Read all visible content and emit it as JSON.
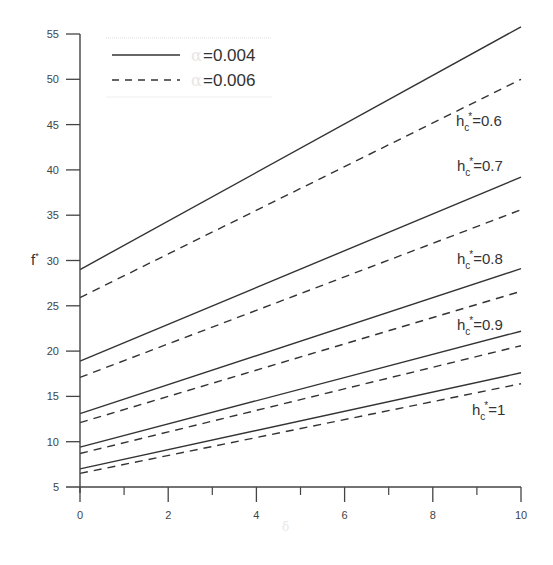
{
  "chart_data": {
    "type": "line",
    "title": "",
    "xlabel": "δ",
    "ylabel": "f*",
    "xlim": [
      0,
      10
    ],
    "ylim": [
      5,
      55
    ],
    "xticks": [
      0,
      2,
      4,
      6,
      8,
      10
    ],
    "xticks_minor": [
      1,
      3,
      5,
      7,
      9
    ],
    "yticks": [
      5,
      10,
      15,
      20,
      25,
      30,
      35,
      40,
      45,
      50,
      55
    ],
    "grid": false,
    "legend": {
      "position": "upper-left",
      "entries": [
        {
          "symbol": "α",
          "text": "=0.004",
          "style": "solid"
        },
        {
          "symbol": "α",
          "text": "=0.006",
          "style": "dashed"
        }
      ]
    },
    "series": [
      {
        "name": "hc*=0.6, α=0.004",
        "style": "solid",
        "x": [
          0,
          10
        ],
        "y": [
          29.0,
          55.8
        ]
      },
      {
        "name": "hc*=0.6, α=0.006",
        "style": "dashed",
        "x": [
          0,
          10
        ],
        "y": [
          25.9,
          50.0
        ]
      },
      {
        "name": "hc*=0.7, α=0.004",
        "style": "solid",
        "x": [
          0,
          10
        ],
        "y": [
          18.9,
          39.2
        ]
      },
      {
        "name": "hc*=0.7, α=0.006",
        "style": "dashed",
        "x": [
          0,
          10
        ],
        "y": [
          17.1,
          35.6
        ]
      },
      {
        "name": "hc*=0.8, α=0.004",
        "style": "solid",
        "x": [
          0,
          10
        ],
        "y": [
          13.1,
          29.1
        ]
      },
      {
        "name": "hc*=0.8, α=0.006",
        "style": "dashed",
        "x": [
          0,
          10
        ],
        "y": [
          12.1,
          26.6
        ]
      },
      {
        "name": "hc*=0.9, α=0.004",
        "style": "solid",
        "x": [
          0,
          10
        ],
        "y": [
          9.4,
          22.2
        ]
      },
      {
        "name": "hc*=0.9, α=0.006",
        "style": "dashed",
        "x": [
          0,
          10
        ],
        "y": [
          8.7,
          20.6
        ]
      },
      {
        "name": "hc*=1, α=0.004",
        "style": "solid",
        "x": [
          0,
          10
        ],
        "y": [
          7.0,
          17.6
        ]
      },
      {
        "name": "hc*=1, α=0.006",
        "style": "dashed",
        "x": [
          0,
          10
        ],
        "y": [
          6.5,
          16.4
        ]
      }
    ],
    "annotations": [
      {
        "base": "h",
        "sub": "c",
        "sup": "*",
        "value": "=0.6",
        "px": 456,
        "py": 126
      },
      {
        "base": "h",
        "sub": "c",
        "sup": "*",
        "value": "=0.7",
        "px": 457,
        "py": 171
      },
      {
        "base": "h",
        "sub": "c",
        "sup": "*",
        "value": "=0.8",
        "px": 457,
        "py": 264
      },
      {
        "base": "h",
        "sub": "c",
        "sup": "*",
        "value": "=0.9",
        "px": 457,
        "py": 330
      },
      {
        "base": "h",
        "sub": "c",
        "sup": "*",
        "value": "=1",
        "px": 472,
        "py": 415
      }
    ]
  },
  "colors": {
    "line": "#333333",
    "axis": "#444444",
    "legend_border": "#dddddd"
  }
}
